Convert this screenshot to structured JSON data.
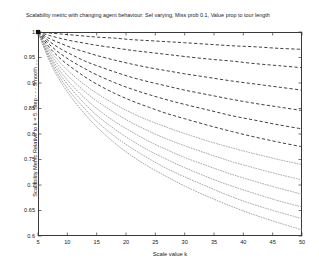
{
  "chart_data": {
    "type": "line",
    "title": "Scalability metric with changing agent behaviour: Sel varying, Miss prob 0.1, Value prop to tour length",
    "xlabel": "Scale value k",
    "ylabel": "Scalability Metric Relative to k = 5: Step - - -  Smooth ....",
    "xlim": [
      5,
      50
    ],
    "ylim": [
      0.6,
      1.0
    ],
    "xticks": [
      5,
      10,
      15,
      20,
      25,
      30,
      35,
      40,
      45,
      50
    ],
    "xticklabels": [
      "5",
      "10",
      "15",
      "20",
      "25",
      "30",
      "35",
      "40",
      "45",
      "50"
    ],
    "yticks": [
      0.6,
      0.65,
      0.7,
      0.75,
      0.8,
      0.85,
      0.9,
      0.95,
      1.0
    ],
    "yticklabels": [
      "0.6",
      "0.65",
      "0.7",
      "0.75",
      "0.8",
      "0.85",
      "0.9",
      "0.95",
      "1"
    ],
    "grid": false,
    "legend": "none",
    "x": [
      5,
      7,
      9,
      11,
      13,
      15,
      18,
      21,
      24,
      27,
      30,
      34,
      38,
      42,
      46,
      50
    ],
    "series": [
      {
        "name": "Step sel 1",
        "style": "dashed",
        "color": "#2b2b2b",
        "values": [
          1.0,
          0.998,
          0.996,
          0.994,
          0.992,
          0.99,
          0.988,
          0.985,
          0.983,
          0.981,
          0.979,
          0.976,
          0.973,
          0.971,
          0.968,
          0.966
        ]
      },
      {
        "name": "Step sel 2",
        "style": "dashed",
        "color": "#2b2b2b",
        "values": [
          1.0,
          0.993,
          0.987,
          0.982,
          0.978,
          0.974,
          0.969,
          0.964,
          0.96,
          0.956,
          0.952,
          0.947,
          0.943,
          0.938,
          0.934,
          0.93
        ]
      },
      {
        "name": "Step sel 3",
        "style": "dashed",
        "color": "#2b2b2b",
        "values": [
          1.0,
          0.987,
          0.977,
          0.968,
          0.961,
          0.954,
          0.945,
          0.937,
          0.93,
          0.924,
          0.918,
          0.911,
          0.904,
          0.898,
          0.892,
          0.886
        ]
      },
      {
        "name": "Step sel 4",
        "style": "dashed",
        "color": "#2b2b2b",
        "values": [
          1.0,
          0.981,
          0.966,
          0.954,
          0.943,
          0.934,
          0.922,
          0.911,
          0.902,
          0.894,
          0.886,
          0.877,
          0.868,
          0.86,
          0.853,
          0.846
        ]
      },
      {
        "name": "Step sel 5",
        "style": "dashed",
        "color": "#2b2b2b",
        "values": [
          1.0,
          0.975,
          0.956,
          0.941,
          0.928,
          0.916,
          0.901,
          0.888,
          0.877,
          0.867,
          0.858,
          0.847,
          0.836,
          0.827,
          0.818,
          0.81
        ]
      },
      {
        "name": "Step sel 6",
        "style": "dashed",
        "color": "#2b2b2b",
        "values": [
          1.0,
          0.969,
          0.946,
          0.928,
          0.912,
          0.898,
          0.88,
          0.865,
          0.852,
          0.84,
          0.83,
          0.817,
          0.805,
          0.794,
          0.784,
          0.775
        ]
      },
      {
        "name": "Smooth sel 1",
        "style": "dotted",
        "color": "#8a8a8a",
        "values": [
          1.0,
          0.964,
          0.937,
          0.915,
          0.896,
          0.88,
          0.859,
          0.841,
          0.826,
          0.813,
          0.801,
          0.786,
          0.773,
          0.761,
          0.75,
          0.74
        ]
      },
      {
        "name": "Smooth sel 2",
        "style": "dotted",
        "color": "#8a8a8a",
        "values": [
          1.0,
          0.959,
          0.928,
          0.904,
          0.883,
          0.865,
          0.842,
          0.822,
          0.805,
          0.79,
          0.777,
          0.761,
          0.746,
          0.733,
          0.721,
          0.71
        ]
      },
      {
        "name": "Smooth sel 3",
        "style": "dotted",
        "color": "#8a8a8a",
        "values": [
          1.0,
          0.954,
          0.92,
          0.893,
          0.87,
          0.85,
          0.825,
          0.804,
          0.785,
          0.769,
          0.754,
          0.737,
          0.721,
          0.707,
          0.694,
          0.682
        ]
      },
      {
        "name": "Smooth sel 4",
        "style": "dotted",
        "color": "#8a8a8a",
        "values": [
          1.0,
          0.95,
          0.913,
          0.884,
          0.859,
          0.837,
          0.81,
          0.787,
          0.767,
          0.75,
          0.734,
          0.715,
          0.698,
          0.683,
          0.669,
          0.657
        ]
      },
      {
        "name": "Smooth sel 5",
        "style": "dotted",
        "color": "#8a8a8a",
        "values": [
          1.0,
          0.946,
          0.906,
          0.875,
          0.849,
          0.825,
          0.796,
          0.772,
          0.751,
          0.732,
          0.716,
          0.696,
          0.677,
          0.661,
          0.647,
          0.634
        ]
      },
      {
        "name": "Smooth sel 6",
        "style": "dotted",
        "color": "#8a8a8a",
        "values": [
          1.0,
          0.942,
          0.9,
          0.867,
          0.839,
          0.814,
          0.783,
          0.757,
          0.735,
          0.716,
          0.698,
          0.677,
          0.658,
          0.641,
          0.626,
          0.612
        ]
      }
    ],
    "origin_marker": {
      "present": true,
      "x": 5,
      "y": 1.0,
      "shape": "filled-square",
      "color": "#111111"
    }
  }
}
